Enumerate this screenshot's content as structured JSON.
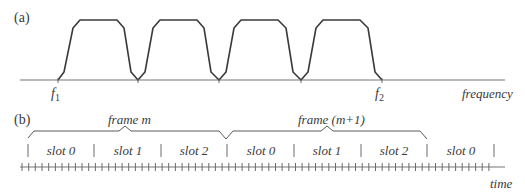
{
  "panel_a": {
    "label": "(a)",
    "axis_label": "frequency",
    "f1_label": "f",
    "f1_sub": "1",
    "f2_label": "f",
    "f2_sub": "2",
    "channel_count": 4
  },
  "panel_b": {
    "label": "(b)",
    "axis_label": "time",
    "frames": [
      {
        "label": "frame m"
      },
      {
        "label": "frame (m+1)"
      }
    ],
    "slots": [
      {
        "label": "slot 0"
      },
      {
        "label": "slot 1"
      },
      {
        "label": "slot 2"
      },
      {
        "label": "slot 0"
      },
      {
        "label": "slot 1"
      },
      {
        "label": "slot 2"
      },
      {
        "label": "slot 0"
      }
    ]
  },
  "colors": {
    "curve": "#3a3a3a",
    "axis": "#777777",
    "text": "#3a3a3a"
  }
}
